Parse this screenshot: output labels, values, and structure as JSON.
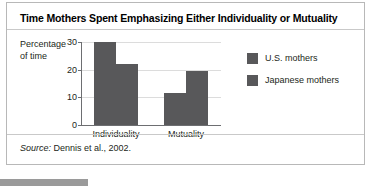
{
  "figure": {
    "title": "Time Mothers Spent Emphasizing Either Individuality or Mutuality",
    "source_prefix": "Source:",
    "source_text": " Dennis et al., 2002."
  },
  "colors": {
    "bar": "#58585a",
    "gridline": "#dcdcdc",
    "axis": "#6d6e71",
    "border": "#b8b8b8",
    "bottom_bar": "#9a9a9a"
  },
  "chart_data": {
    "type": "bar",
    "title": "Time Mothers Spent Emphasizing Either Individuality or Mutuality",
    "xlabel": "",
    "ylabel": "Percentage of time",
    "ylabel_line1": "Percentage",
    "ylabel_line2": "of time",
    "categories": [
      "Individuality",
      "Mutuality"
    ],
    "ylim": [
      0,
      30
    ],
    "yticks": [
      0,
      10,
      20,
      30
    ],
    "ytick_labels": [
      "0",
      "10",
      "20",
      "30"
    ],
    "grid": true,
    "legend_position": "right",
    "series": [
      {
        "name": "U.S. mothers",
        "values": [
          30,
          11.5
        ],
        "color": "#58585a"
      },
      {
        "name": "Japanese mothers",
        "values": [
          22,
          19.5
        ],
        "color": "#58585a"
      }
    ],
    "source": "Source: Dennis et al., 2002."
  }
}
